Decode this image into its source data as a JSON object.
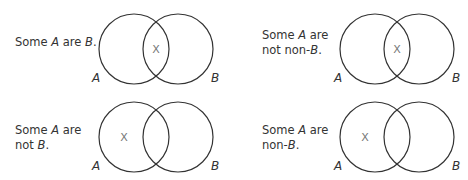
{
  "diagrams": [
    {
      "id": "some-a-are-b",
      "caption": [
        [
          "Some ",
          "A",
          " are ",
          "B",
          "."
        ]
      ],
      "set_labels": [
        "A",
        "B"
      ],
      "mark": "X",
      "mark_region": "intersection"
    },
    {
      "id": "some-a-are-not-non-b",
      "caption": [
        [
          "Some ",
          "A",
          " are"
        ],
        [
          "not non-",
          "B",
          "."
        ]
      ],
      "set_labels": [
        "A",
        "B"
      ],
      "mark": "X",
      "mark_region": "intersection"
    },
    {
      "id": "some-a-are-not-b",
      "caption": [
        [
          "Some ",
          "A",
          " are"
        ],
        [
          "not ",
          "B",
          "."
        ]
      ],
      "set_labels": [
        "A",
        "B"
      ],
      "mark": "X",
      "mark_region": "A-only"
    },
    {
      "id": "some-a-are-non-b",
      "caption": [
        [
          "Some ",
          "A",
          " are"
        ],
        [
          "non-",
          "B",
          "."
        ]
      ],
      "set_labels": [
        "A",
        "B"
      ],
      "mark": "X",
      "mark_region": "A-only"
    }
  ]
}
